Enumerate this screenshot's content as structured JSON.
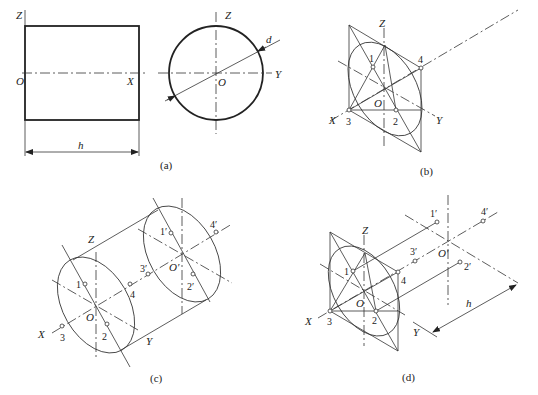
{
  "figure": {
    "panels": [
      {
        "id": "a",
        "caption": "(a)",
        "front_view": {
          "labels": {
            "z": "Z",
            "o": "O",
            "x": "X"
          },
          "dimension": "h"
        },
        "side_view": {
          "labels": {
            "z": "Z",
            "o": "O",
            "y": "Y"
          },
          "dimension": "d"
        }
      },
      {
        "id": "b",
        "caption": "(b)",
        "labels": {
          "z": "Z",
          "o": "O",
          "x": "X",
          "y": "Y"
        },
        "points": [
          "1",
          "2",
          "3",
          "4"
        ]
      },
      {
        "id": "c",
        "caption": "(c)",
        "labels": {
          "z": "Z",
          "o": "O",
          "o_prime": "O′",
          "x": "X",
          "y": "Y"
        },
        "points": [
          "1",
          "2",
          "3",
          "4"
        ],
        "points_prime": [
          "1′",
          "2′",
          "3′",
          "4′"
        ]
      },
      {
        "id": "d",
        "caption": "(d)",
        "labels": {
          "z": "Z",
          "o": "O",
          "o_prime": "O′",
          "x": "X",
          "y": "Y"
        },
        "points": [
          "1",
          "2",
          "3",
          "4"
        ],
        "points_prime": [
          "1′",
          "2′",
          "3′",
          "4′"
        ],
        "dimension": "h"
      }
    ]
  }
}
